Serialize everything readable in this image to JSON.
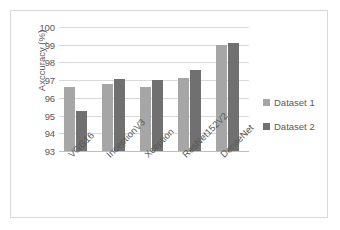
{
  "chart_data": {
    "type": "bar",
    "title": "",
    "subtitle": "",
    "xlabel": "",
    "ylabel": "Axccuracy (%)",
    "categories": [
      "VGG16",
      "InceptionV3",
      "Xception",
      "ResNet152V2",
      "DenseNet"
    ],
    "series": [
      {
        "name": "Dataset 1",
        "color": "#a6a6a6",
        "values": [
          96.6,
          96.8,
          96.6,
          97.15,
          99.0
        ]
      },
      {
        "name": "Dataset 2",
        "color": "#707070",
        "values": [
          95.25,
          97.05,
          97.0,
          97.6,
          99.1
        ]
      }
    ],
    "ylim": [
      93,
      100
    ],
    "ytick_step": 1,
    "ytick_labels": [
      "100",
      "99",
      "98",
      "97",
      "96",
      "95",
      "94",
      "93"
    ],
    "grid": "horizontal",
    "legend_position": "right",
    "grid_color": "#d9d9d9",
    "axis_color": "#bfbfbf",
    "text_color": "#595959",
    "plot_background": "#ffffff",
    "border_color": "#d9d9d9"
  }
}
